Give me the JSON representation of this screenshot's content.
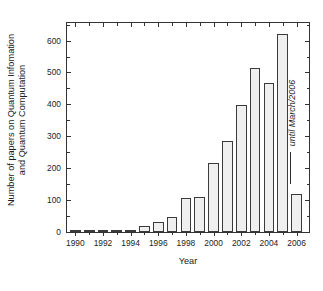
{
  "figure": {
    "background": "#ffffff",
    "frame_color": "#333333",
    "bar_fill": "#efefef",
    "bar_stroke": "#3a3a3a"
  },
  "chart_data": {
    "type": "bar",
    "title": "",
    "xlabel": "Year",
    "ylabel_line1": "Number of papers on Quantum Infomation",
    "ylabel_line2": "and Quantum Computation",
    "categories": [
      "1990",
      "1991",
      "1992",
      "1993",
      "1994",
      "1995",
      "1996",
      "1997",
      "1998",
      "1999",
      "2000",
      "2001",
      "2002",
      "2003",
      "2004",
      "2005",
      "2006"
    ],
    "values": [
      2,
      3,
      7,
      3,
      4,
      19,
      31,
      46,
      107,
      110,
      215,
      286,
      397,
      513,
      466,
      620,
      118
    ],
    "ylim": [
      0,
      655
    ],
    "xlim": [
      1989.4,
      2006.9
    ],
    "ytick_labels": [
      "0",
      "100",
      "200",
      "300",
      "400",
      "500",
      "600"
    ],
    "ytick_values": [
      0,
      100,
      200,
      300,
      400,
      500,
      600
    ],
    "yminor_step": 50,
    "xtick_labels": [
      "1990",
      "1992",
      "1994",
      "1996",
      "1998",
      "2000",
      "2002",
      "2004",
      "2006"
    ],
    "xtick_values": [
      1990,
      1992,
      1994,
      1996,
      1998,
      2000,
      2002,
      2004,
      2006
    ],
    "xminor_step": 1,
    "grid": false,
    "legend": null,
    "annotations": [
      {
        "text": "until March/2006",
        "points_to_category": "2006",
        "rotation": -90,
        "style": "italic",
        "leader_line": true
      }
    ]
  }
}
